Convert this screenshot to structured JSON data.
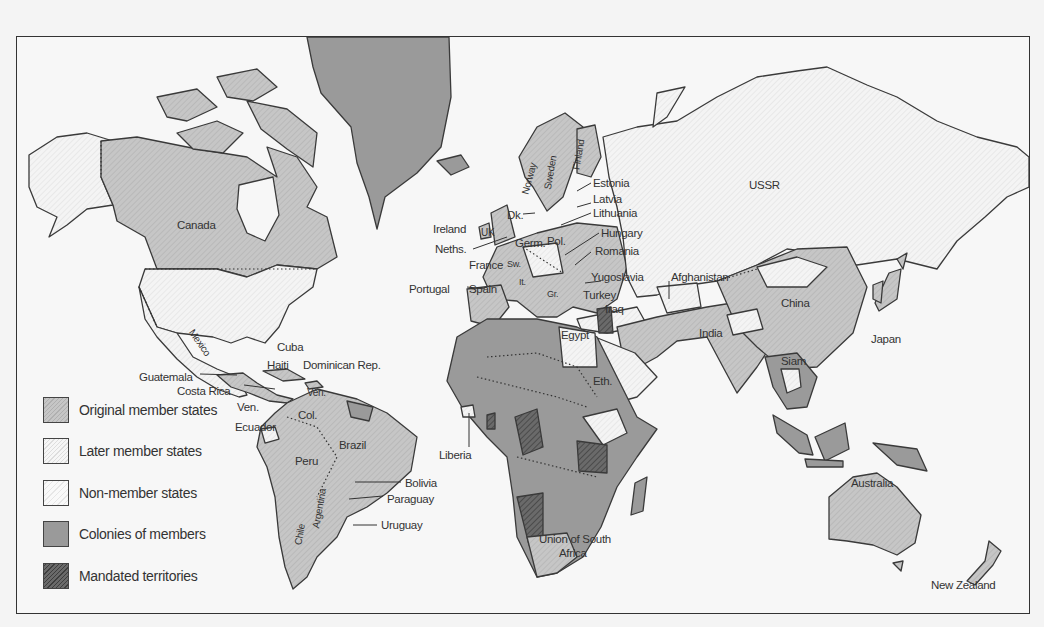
{
  "map": {
    "title": "League of Nations membership world map",
    "colors": {
      "original": "#c4c4c4",
      "later": "#f2f2f2",
      "non_member": "#f7f7f7",
      "colony": "#9a9a9a",
      "mandate": "#5e5e5e",
      "ocean": "#f7f7f7",
      "border": "#3a3a3a"
    },
    "legend": [
      {
        "key": "original",
        "label": "Original member states"
      },
      {
        "key": "later",
        "label": "Later member states"
      },
      {
        "key": "non_member",
        "label": "Non-member states"
      },
      {
        "key": "colony",
        "label": "Colonies of members"
      },
      {
        "key": "mandate",
        "label": "Mandated territories"
      }
    ],
    "labels": {
      "canada": "Canada",
      "mexico": "Mexico",
      "cuba": "Cuba",
      "haiti": "Haiti",
      "dominican_rep": "Dominican Rep.",
      "guatemala": "Guatemala",
      "costa_rica": "Costa Rica",
      "ven_left": "Ven.",
      "ven_top": "Ven.",
      "col": "Col.",
      "ecuador": "Ecuador",
      "brazil": "Brazil",
      "peru": "Peru",
      "bolivia": "Bolivia",
      "paraguay": "Paraguay",
      "uruguay": "Uruguay",
      "chile": "Chile",
      "argentina": "Argentina",
      "norway": "Norway",
      "sweden": "Sweden",
      "finland": "Finland",
      "estonia": "Estonia",
      "latvia": "Latvia",
      "lithuania": "Lithuania",
      "dk": "Dk.",
      "ireland": "Ireland",
      "uk": "UK",
      "neths": "Neths.",
      "germ": "Germ.",
      "pol": "Pol.",
      "hungary": "Hungary",
      "romania": "Romania",
      "france": "France",
      "sw": "Sw.",
      "yugoslavia": "Yugoslavia",
      "portugal": "Portugal",
      "spain": "Spain",
      "it": "It.",
      "gr": "Gr.",
      "turkey": "Turkey",
      "iraq": "Iraq",
      "egypt": "Egypt",
      "eth": "Eth.",
      "liberia": "Liberia",
      "union_south_africa_1": "Union of South",
      "union_south_africa_2": "Africa",
      "ussr": "USSR",
      "afghanistan": "Afghanistan",
      "china": "China",
      "japan": "Japan",
      "india": "India",
      "siam": "Siam",
      "australia": "Australia",
      "new_zealand": "New Zealand"
    }
  }
}
